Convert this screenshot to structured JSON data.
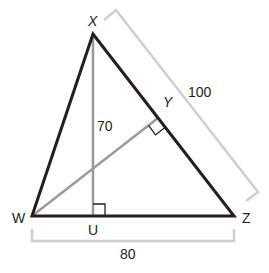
{
  "diagram": {
    "type": "geometry-triangle",
    "colors": {
      "triangle": "#231f20",
      "construction": "#9a9a9a",
      "dimension": "#c8c8c8",
      "text": "#231f20"
    },
    "vertices": {
      "X": {
        "label": "X",
        "x": 93,
        "y": 34
      },
      "W": {
        "label": "W",
        "x": 32,
        "y": 216
      },
      "Z": {
        "label": "Z",
        "x": 234,
        "y": 216
      },
      "U": {
        "label": "U",
        "x": 93,
        "y": 216
      },
      "Y": {
        "label": "Y",
        "x": 158,
        "y": 118
      }
    },
    "segments": {
      "XU": {
        "label": "70",
        "description": "altitude from X to WZ"
      },
      "WY": {
        "description": "altitude from W to XZ"
      },
      "XZ": {
        "label": "100"
      },
      "WZ": {
        "label": "80"
      }
    },
    "right_angles": [
      "U",
      "Y"
    ]
  },
  "labels": {
    "X": "X",
    "Y": "Y",
    "W": "W",
    "U": "U",
    "Z": "Z",
    "xu_length": "70",
    "xz_length": "100",
    "wz_length": "80"
  }
}
